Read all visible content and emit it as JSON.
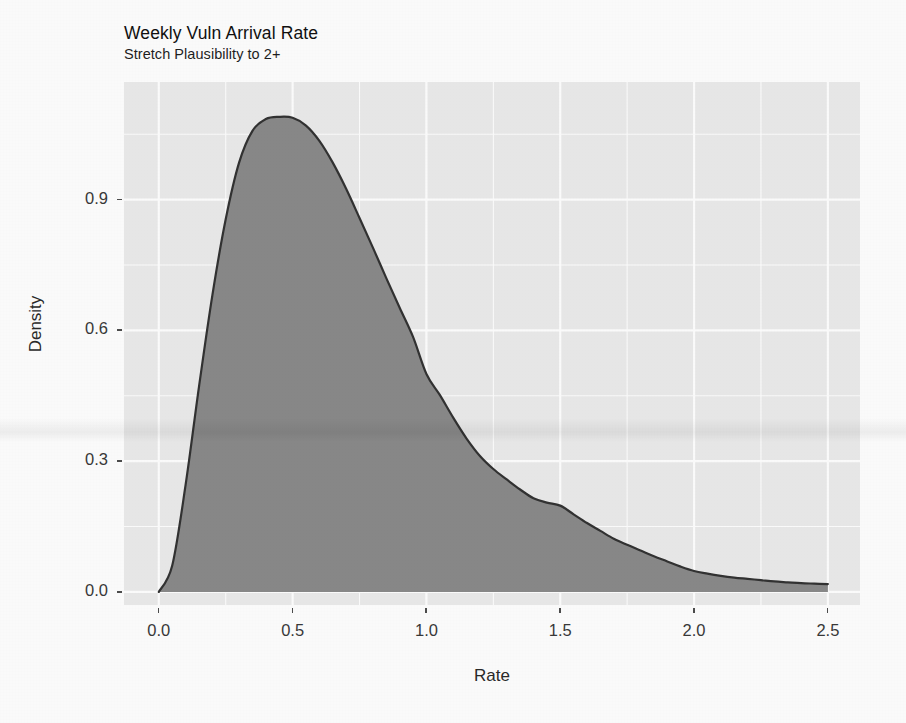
{
  "chart_data": {
    "type": "area",
    "title": "Weekly Vuln Arrival Rate",
    "subtitle": "Stretch Plausibility to 2+",
    "xlabel": "Rate",
    "ylabel": "Density",
    "xlim": [
      -0.13,
      2.62
    ],
    "ylim": [
      -0.03,
      1.17
    ],
    "xticks": [
      0.0,
      0.5,
      1.0,
      1.5,
      2.0,
      2.5
    ],
    "xticklabels": [
      "0.0",
      "0.5",
      "1.0",
      "1.5",
      "2.0",
      "2.5"
    ],
    "yticks": [
      0.0,
      0.3,
      0.6,
      0.9
    ],
    "yticklabels": [
      "0.0",
      "0.3",
      "0.6",
      "0.9"
    ],
    "grid": true,
    "legend": "none",
    "panel_background": "#ebebeb",
    "grid_color": "#ffffff",
    "fill_color": "#8a8a8a",
    "line_color": "#333333",
    "series": [
      {
        "name": "Density",
        "x": [
          0.0,
          0.05,
          0.1,
          0.15,
          0.2,
          0.25,
          0.3,
          0.35,
          0.4,
          0.45,
          0.5,
          0.55,
          0.6,
          0.65,
          0.7,
          0.75,
          0.8,
          0.85,
          0.9,
          0.95,
          1.0,
          1.05,
          1.1,
          1.15,
          1.2,
          1.25,
          1.3,
          1.35,
          1.4,
          1.45,
          1.5,
          1.55,
          1.6,
          1.65,
          1.7,
          1.75,
          1.8,
          1.85,
          1.9,
          1.95,
          2.0,
          2.05,
          2.1,
          2.15,
          2.2,
          2.25,
          2.3,
          2.35,
          2.4,
          2.45,
          2.5
        ],
        "y": [
          0.0,
          0.06,
          0.245,
          0.47,
          0.68,
          0.855,
          0.985,
          1.058,
          1.085,
          1.09,
          1.088,
          1.07,
          1.035,
          0.985,
          0.925,
          0.858,
          0.79,
          0.72,
          0.652,
          0.585,
          0.5,
          0.452,
          0.4,
          0.352,
          0.312,
          0.282,
          0.258,
          0.235,
          0.215,
          0.205,
          0.198,
          0.178,
          0.158,
          0.14,
          0.122,
          0.108,
          0.095,
          0.082,
          0.07,
          0.058,
          0.048,
          0.042,
          0.037,
          0.033,
          0.03,
          0.027,
          0.024,
          0.022,
          0.02,
          0.019,
          0.018
        ]
      }
    ],
    "annotations": {
      "peak_rate": 0.5,
      "peak_density": 1.09
    }
  },
  "axes": {
    "y_ticks": [
      {
        "label": "0.9",
        "value": 0.9
      },
      {
        "label": "0.6",
        "value": 0.6
      },
      {
        "label": "0.3",
        "value": 0.3
      },
      {
        "label": "0.0",
        "value": 0.0
      }
    ],
    "x_ticks": [
      {
        "label": "0.0",
        "value": 0.0
      },
      {
        "label": "0.5",
        "value": 0.5
      },
      {
        "label": "1.0",
        "value": 1.0
      },
      {
        "label": "1.5",
        "value": 1.5
      },
      {
        "label": "2.0",
        "value": 2.0
      },
      {
        "label": "2.5",
        "value": 2.5
      }
    ]
  }
}
